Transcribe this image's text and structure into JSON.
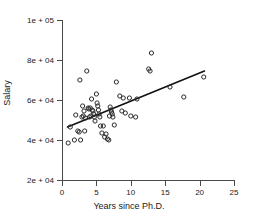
{
  "chart_data": {
    "type": "scatter",
    "title": "",
    "xlabel": "Years since Ph.D.",
    "ylabel": "Salary",
    "xlim": [
      0,
      25
    ],
    "ylim": [
      20000,
      100000
    ],
    "xticks": [
      0,
      5,
      10,
      15,
      20,
      25
    ],
    "xticklabels": [
      "0",
      "5",
      "10",
      "15",
      "20",
      "25"
    ],
    "yticks": [
      20000,
      40000,
      60000,
      80000,
      100000
    ],
    "yticklabels": [
      "2e + 04",
      "4e + 04",
      "6e + 04",
      "8e + 04",
      "1e + 05"
    ],
    "grid": false,
    "legend": null,
    "marker": "open-circle",
    "marker_color": "#2b2b2b",
    "series": [
      {
        "name": "observations",
        "points": [
          [
            0.9,
            38500
          ],
          [
            1.2,
            46500
          ],
          [
            1.8,
            40000
          ],
          [
            2.0,
            52500
          ],
          [
            2.3,
            44500
          ],
          [
            2.5,
            44000
          ],
          [
            2.6,
            70000
          ],
          [
            2.7,
            40000
          ],
          [
            2.9,
            51500
          ],
          [
            3.0,
            57000
          ],
          [
            3.1,
            52000
          ],
          [
            3.2,
            54500
          ],
          [
            3.3,
            44500
          ],
          [
            3.4,
            51000
          ],
          [
            3.6,
            74500
          ],
          [
            3.8,
            56000
          ],
          [
            3.9,
            55500
          ],
          [
            4.0,
            51500
          ],
          [
            4.1,
            56000
          ],
          [
            4.2,
            52000
          ],
          [
            4.3,
            60500
          ],
          [
            4.4,
            55000
          ],
          [
            4.5,
            54500
          ],
          [
            4.6,
            53000
          ],
          [
            4.7,
            51500
          ],
          [
            4.8,
            49500
          ],
          [
            5.0,
            63000
          ],
          [
            5.1,
            58500
          ],
          [
            5.2,
            57000
          ],
          [
            5.3,
            55000
          ],
          [
            5.4,
            53000
          ],
          [
            5.5,
            51500
          ],
          [
            5.6,
            47000
          ],
          [
            5.8,
            43500
          ],
          [
            6.0,
            47000
          ],
          [
            6.2,
            41500
          ],
          [
            6.4,
            43000
          ],
          [
            6.6,
            40500
          ],
          [
            6.8,
            40000
          ],
          [
            6.9,
            52000
          ],
          [
            7.0,
            56500
          ],
          [
            7.1,
            55000
          ],
          [
            7.2,
            54000
          ],
          [
            7.3,
            53000
          ],
          [
            7.4,
            51500
          ],
          [
            7.6,
            47500
          ],
          [
            7.9,
            69000
          ],
          [
            8.4,
            62000
          ],
          [
            8.7,
            54500
          ],
          [
            8.9,
            61000
          ],
          [
            9.2,
            53500
          ],
          [
            9.8,
            61000
          ],
          [
            10.0,
            52000
          ],
          [
            10.7,
            51500
          ],
          [
            10.9,
            60500
          ],
          [
            12.6,
            75500
          ],
          [
            12.8,
            74500
          ],
          [
            13.0,
            83500
          ],
          [
            15.7,
            66500
          ],
          [
            17.7,
            61500
          ],
          [
            20.6,
            71500
          ]
        ]
      }
    ],
    "fit_line": {
      "name": "least-squares fit",
      "color": "#111111",
      "x_start": 0.8,
      "y_start": 46500,
      "x_end": 20.7,
      "y_end": 74500
    }
  }
}
